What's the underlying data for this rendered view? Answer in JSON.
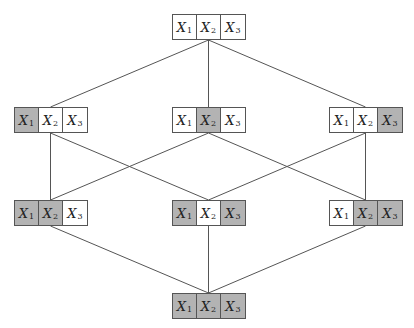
{
  "diagram": {
    "type": "lattice",
    "cell_labels": [
      {
        "var": "X",
        "sub": "1"
      },
      {
        "var": "X",
        "sub": "2"
      },
      {
        "var": "X",
        "sub": "3"
      }
    ],
    "colors": {
      "selected": "#b3b3b3",
      "unselected": "#ffffff",
      "line": "#555555"
    },
    "nodes": [
      {
        "id": "top",
        "x": 172,
        "y": 14,
        "selected": [
          false,
          false,
          false
        ]
      },
      {
        "id": "r1a",
        "x": 14,
        "y": 107,
        "selected": [
          true,
          false,
          false
        ]
      },
      {
        "id": "r1b",
        "x": 172,
        "y": 107,
        "selected": [
          false,
          true,
          false
        ]
      },
      {
        "id": "r1c",
        "x": 329,
        "y": 107,
        "selected": [
          false,
          false,
          true
        ]
      },
      {
        "id": "r2a",
        "x": 14,
        "y": 200,
        "selected": [
          true,
          true,
          false
        ]
      },
      {
        "id": "r2b",
        "x": 172,
        "y": 200,
        "selected": [
          true,
          false,
          true
        ]
      },
      {
        "id": "r2c",
        "x": 329,
        "y": 200,
        "selected": [
          false,
          true,
          true
        ]
      },
      {
        "id": "bot",
        "x": 172,
        "y": 293,
        "selected": [
          true,
          true,
          true
        ]
      }
    ],
    "edges": [
      [
        "top",
        "r1a"
      ],
      [
        "top",
        "r1b"
      ],
      [
        "top",
        "r1c"
      ],
      [
        "r1a",
        "r2a"
      ],
      [
        "r1a",
        "r2b"
      ],
      [
        "r1b",
        "r2a"
      ],
      [
        "r1b",
        "r2c"
      ],
      [
        "r1c",
        "r2b"
      ],
      [
        "r1c",
        "r2c"
      ],
      [
        "r2a",
        "bot"
      ],
      [
        "r2b",
        "bot"
      ],
      [
        "r2c",
        "bot"
      ]
    ]
  }
}
